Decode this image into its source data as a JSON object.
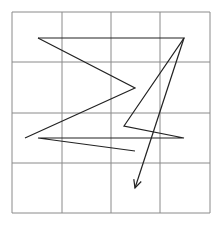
{
  "diagram": {
    "type": "path-on-grid",
    "grid": {
      "x_lines": [
        12,
        62,
        111,
        160,
        210
      ],
      "y_lines": [
        12,
        62,
        113,
        163,
        213
      ],
      "color": "#8a8a8a",
      "rows": 4,
      "cols": 4
    },
    "stroke_color": "#222222",
    "paths": [
      {
        "name": "zigzag-path",
        "points": [
          [
            38,
            38
          ],
          [
            135,
            88
          ],
          [
            25,
            138
          ]
        ]
      },
      {
        "name": "main-path",
        "points": [
          [
            38,
            38
          ],
          [
            184,
            38
          ],
          [
            124,
            126
          ],
          [
            184,
            138
          ],
          [
            38,
            138
          ],
          [
            135,
            151
          ]
        ]
      },
      {
        "name": "arrow-path",
        "points": [
          [
            184,
            38
          ],
          [
            135,
            188
          ]
        ],
        "arrowhead": true
      }
    ]
  }
}
